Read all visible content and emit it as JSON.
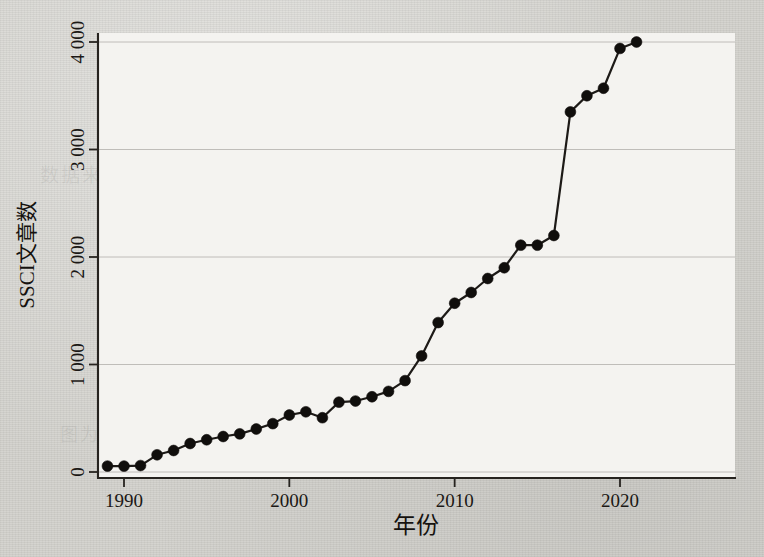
{
  "figure": {
    "background_color": "#d3d2cd",
    "plot_background_color": "#f4f3f0",
    "line_color": "#1d1a17",
    "marker_color": "#100e0c",
    "grid_color": "#b9b7b2",
    "axis_color": "#26231f"
  },
  "ghost_text": [
    {
      "text": "数据来源于汤森路透公司数据库",
      "x": 40,
      "y": 160,
      "size": 19
    },
    {
      "text": "SSCI 收录的文章数量统计结果",
      "x": 120,
      "y": 178,
      "size": 17
    },
    {
      "text": "在过去三十余年间呈现出持续快速增长的总体态势",
      "x": 110,
      "y": 325,
      "size": 18
    },
    {
      "text": "相关研究领域的国际影响力不断提升",
      "x": 190,
      "y": 352,
      "size": 18
    },
    {
      "text": "图为历年国际期刊发文量变化趋势示意",
      "x": 60,
      "y": 420,
      "size": 18
    }
  ],
  "chart_data": {
    "type": "line",
    "title": "",
    "subtitle": "",
    "xlabel": "年份",
    "ylabel": "SSCI文章数",
    "xlim": [
      1988.2,
      1988.2
    ],
    "ylim": [
      0,
      4150
    ],
    "x_ticks": [
      1990,
      2000,
      2010,
      2020
    ],
    "x_tick_labels": [
      "1990",
      "2000",
      "2010",
      "2020"
    ],
    "y_ticks": [
      0,
      1000,
      2000,
      3000,
      4000
    ],
    "y_tick_labels": [
      "0",
      "1 000",
      "2 000",
      "3 000",
      "4 000"
    ],
    "grid": "horizontal",
    "legend": "none",
    "marker": "filled-circle",
    "x": [
      1989,
      1990,
      1991,
      1992,
      1993,
      1994,
      1995,
      1996,
      1997,
      1998,
      1999,
      2000,
      2001,
      2002,
      2003,
      2004,
      2005,
      2006,
      2007,
      2008,
      2009,
      2010,
      2011,
      2012,
      2013,
      2014,
      2015,
      2016,
      2017,
      2018,
      2019,
      2020,
      2021
    ],
    "values": [
      55,
      55,
      60,
      160,
      200,
      265,
      300,
      330,
      355,
      400,
      450,
      530,
      560,
      505,
      650,
      660,
      700,
      750,
      850,
      1080,
      1390,
      1570,
      1670,
      1800,
      1900,
      2110,
      2110,
      2200,
      3350,
      3500,
      3570,
      3940,
      4000
    ],
    "series": [
      {
        "name": "SSCI文章数",
        "values": [
          55,
          55,
          60,
          160,
          200,
          265,
          300,
          330,
          355,
          400,
          450,
          530,
          560,
          505,
          650,
          660,
          700,
          750,
          850,
          1080,
          1390,
          1570,
          1670,
          1800,
          1900,
          2110,
          2110,
          2200,
          3350,
          3500,
          3570,
          3940,
          4000
        ]
      }
    ]
  }
}
